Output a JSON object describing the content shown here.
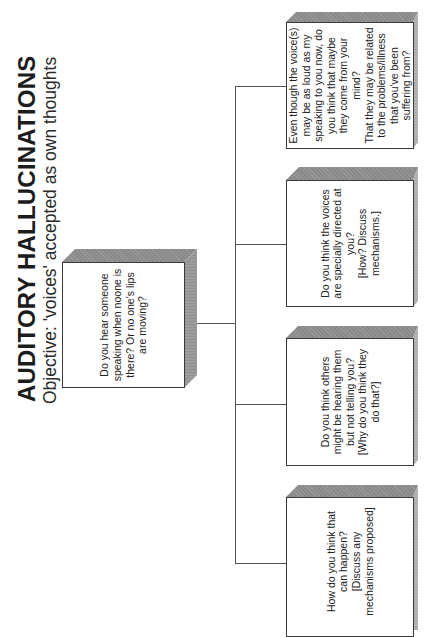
{
  "header": {
    "title": "AUDITORY HALLUCINATIONS",
    "subtitle": "Objective:  'voices' accepted as own thoughts"
  },
  "root_node": {
    "text": "Do you hear someone\nspeaking when noone is\nthere?  Or no one's lips\nare moving?"
  },
  "child_nodes": [
    {
      "text": "Even though the voice(s)\nmay be as loud as my\nspeaking to you now, do\nyou think that maybe\nthey come from your\nmind?\nThat they may be related\nto the problems/illness\nthat you've been\nsuffering from?"
    },
    {
      "text": "Do you think the voices\nare specially directed at\nyou?\n[How?  Discuss\nmechanisms.]"
    },
    {
      "text": "Do you think others\nmight be hearing them\nbut not telling you?\n[Why do you think they\ndo that?]"
    },
    {
      "text": "How do you think that\ncan happen?\n[Discuss any\nmechanisms proposed]"
    }
  ],
  "colors": {
    "line": "#555555",
    "box_border": "#3a3a3a",
    "box_top_face": "#8a8a8a",
    "box_side_face": "#b5b5b5"
  }
}
